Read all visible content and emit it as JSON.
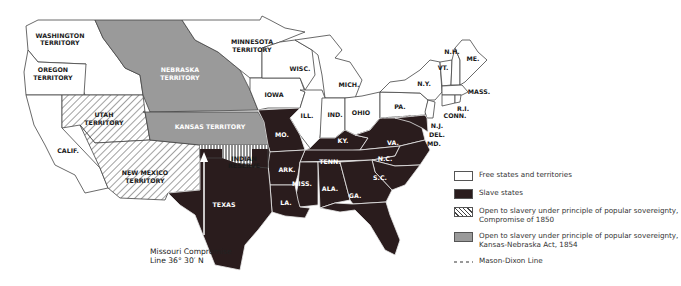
{
  "map": {
    "labels": {
      "washington": "WASHINGTON TERRITORY",
      "washington_l1": "WASHINGTON",
      "washington_l2": "TERRITORY",
      "oregon_l1": "OREGON",
      "oregon_l2": "TERRITORY",
      "nebraska_l1": "NEBRASKA",
      "nebraska_l2": "TERRITORY",
      "minnesota_l1": "MINNESOTA",
      "minnesota_l2": "TERRITORY",
      "utah_l1": "UTAH",
      "utah_l2": "TERRITORY",
      "kansas": "KANSAS TERRITORY",
      "calif": "CALIF.",
      "newmexico_l1": "NEW MEXICO",
      "newmexico_l2": "TERRITORY",
      "indian_l1": "INDIAN",
      "indian_l2": "RESERVE",
      "texas": "TEXAS",
      "wisc": "WISC.",
      "mich": "MICH.",
      "iowa": "IOWA",
      "ill": "ILL.",
      "ind": "IND.",
      "ohio": "OHIO",
      "pa": "PA.",
      "ny": "N.Y.",
      "vt": "VT.",
      "nh": "N.H.",
      "me": "ME.",
      "mass": "MASS.",
      "ri": "R.I.",
      "conn": "CONN.",
      "nj": "N.J.",
      "del": "DEL.",
      "md": "MD.",
      "mo": "MO.",
      "ky": "KY.",
      "va": "VA.",
      "tenn": "TENN.",
      "nc": "N.C.",
      "ark": "ARK.",
      "sc": "S.C.",
      "miss": "MISS.",
      "ala": "ALA.",
      "ga": "GA.",
      "la": "LA.",
      "fla": "FLA."
    },
    "annotation": {
      "line1": "Missouri Compromise",
      "line2": "Line 36° 30′ N"
    },
    "colors": {
      "free": "#ffffff",
      "slave": "#2a1c1d",
      "popular_sovereignty_1854": "#9a9a9a",
      "border": "#444444"
    }
  },
  "legend": {
    "items": [
      {
        "swatch": "free",
        "text": "Free states and territories"
      },
      {
        "swatch": "slave",
        "text": "Slave states"
      },
      {
        "swatch": "hatch",
        "text": "Open to slavery under principle of popular sovereignty, Compromise of 1850"
      },
      {
        "swatch": "gray",
        "text": "Open to slavery under principle of popular sovereignty, Kansas-Nebraska Act, 1854"
      },
      {
        "swatch": "dash",
        "text": "Mason-Dixon Line"
      }
    ]
  }
}
